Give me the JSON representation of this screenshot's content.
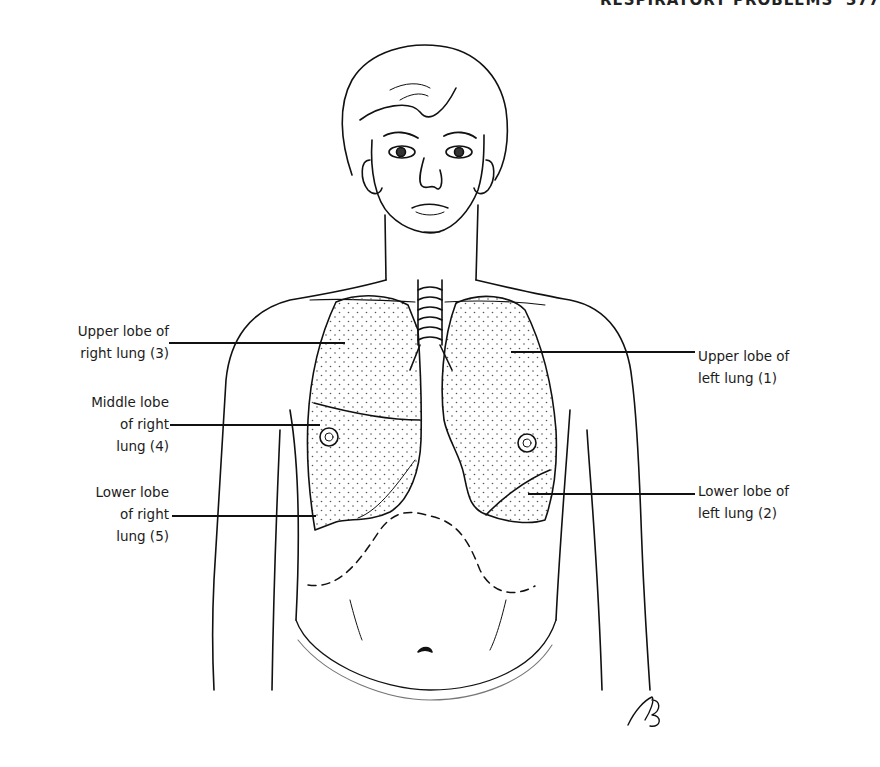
{
  "running_head": {
    "title": "RESPIRATORY PROBLEMS",
    "page_number": "377"
  },
  "figure": {
    "signature": "RB",
    "labels": {
      "left": [
        {
          "id": "upper-lobe-right-lung",
          "lines": [
            "Upper lobe of",
            "right lung (3)"
          ]
        },
        {
          "id": "middle-lobe-right-lung",
          "lines": [
            "Middle lobe",
            "of right",
            "lung (4)"
          ]
        },
        {
          "id": "lower-lobe-right-lung",
          "lines": [
            "Lower lobe",
            "of right",
            "lung (5)"
          ]
        }
      ],
      "right": [
        {
          "id": "upper-lobe-left-lung",
          "lines": [
            "Upper lobe of",
            "left lung (1)"
          ]
        },
        {
          "id": "lower-lobe-left-lung",
          "lines": [
            "Lower lobe of",
            "left lung (2)"
          ]
        }
      ]
    }
  }
}
